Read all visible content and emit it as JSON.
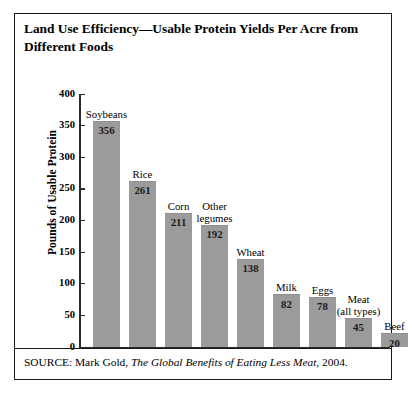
{
  "figure": {
    "title": "Land Use Efficiency—Usable Protein Yields Per Acre from Different Foods",
    "source_prefix": "SOURCE: Mark Gold, ",
    "source_title": "The Global Benefits of Eating Less Meat",
    "source_suffix": ", 2004."
  },
  "chart_data": {
    "type": "bar",
    "title": "Land Use Efficiency—Usable Protein Yields Per Acre from Different Foods",
    "xlabel": "",
    "ylabel": "Pounds of Usable Protein",
    "ylim": [
      0,
      400
    ],
    "yticks": [
      0,
      50,
      100,
      150,
      200,
      250,
      300,
      350,
      400
    ],
    "ytick_labels": [
      "0",
      "50",
      "100",
      "150",
      "200",
      "250",
      "300",
      "350",
      "400"
    ],
    "grid": false,
    "legend": false,
    "bar_color": "#9b9b9b",
    "categories": [
      "Soybeans",
      "Rice",
      "Corn",
      "Other legumes",
      "Wheat",
      "Milk",
      "Eggs",
      "Meat (all types)",
      "Beef"
    ],
    "category_label_lines": [
      [
        "Soybeans"
      ],
      [
        "Rice"
      ],
      [
        "Corn"
      ],
      [
        "Other",
        "legumes"
      ],
      [
        "Wheat"
      ],
      [
        "Milk"
      ],
      [
        "Eggs"
      ],
      [
        "Meat",
        "(all types)"
      ],
      [
        "Beef"
      ]
    ],
    "values": [
      356,
      261,
      211,
      192,
      138,
      82,
      78,
      45,
      20
    ],
    "value_labels": [
      "356",
      "261",
      "211",
      "192",
      "138",
      "82",
      "78",
      "45",
      "20"
    ]
  }
}
